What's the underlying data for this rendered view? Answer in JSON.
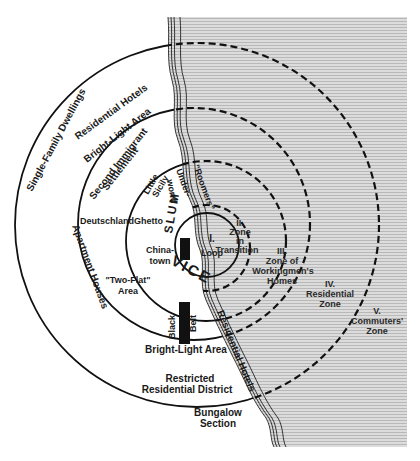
{
  "diagram": {
    "type": "concentric-zone-model",
    "colors": {
      "ink": "#111111",
      "lake_fill": "#d9d9d9",
      "lake_lines": "#bdbdbd",
      "background": "#ffffff"
    },
    "zones": [
      {
        "numeral": "I.",
        "name": "Loop"
      },
      {
        "numeral": "II.",
        "name_line1": "Zone",
        "name_line2": "in",
        "name_line3": "Transition"
      },
      {
        "numeral": "III.",
        "name_line1": "Zone of",
        "name_line2": "Workingmen's",
        "name_line3": "Homes"
      },
      {
        "numeral": "IV.",
        "name_line1": "Residential",
        "name_line2": "Zone"
      },
      {
        "numeral": "V.",
        "name_line1": "Commuters'",
        "name_line2": "Zone"
      }
    ],
    "areas": {
      "single_family": "Single-Family Dwellings",
      "residential_hotels_top": "Residential Hotels",
      "bright_light_top": "Bright-Light Area",
      "second_immigrant_1": "Second Immigrant",
      "second_immigrant_2": "Settlement",
      "roomers": "\"Roomers\"",
      "underworld_1": "Under-",
      "underworld_2": "world",
      "little_sicily_1": "Little",
      "little_sicily_2": "Sicily",
      "slum": "SLUM",
      "deutschland": "Deutschland",
      "ghetto": "Ghetto",
      "chinatown_1": "China-",
      "chinatown_2": "town",
      "vice": "VICE",
      "two_flat_1": "\"Two-Flat\"",
      "two_flat_2": "Area",
      "apartment_houses": "Apartment Houses",
      "black": "Black",
      "belt": "Belt",
      "bright_light_bottom": "Bright-Light Area",
      "restricted_1": "Restricted",
      "restricted_2": "Residential District",
      "residential_hotels_shore": "Residential Hotels",
      "bungalow_1": "Bungalow",
      "bungalow_2": "Section"
    }
  }
}
